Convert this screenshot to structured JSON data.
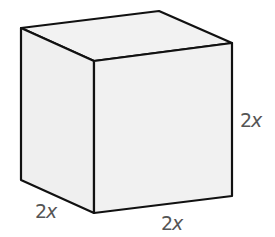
{
  "diagram": {
    "type": "cube",
    "colors": {
      "edge": "#111111",
      "top_face": "#f2f2f2",
      "left_face": "#efefef",
      "front_face": "#f1f1f1",
      "label": "#555555"
    },
    "vertices": {
      "back_top_left": [
        21,
        28
      ],
      "back_top_right": [
        159,
        11
      ],
      "front_top_left": [
        94,
        61
      ],
      "front_top_right": [
        232,
        43
      ],
      "back_bottom_left": [
        21,
        180
      ],
      "front_bottom_left": [
        94,
        213
      ],
      "front_bottom_right": [
        232,
        196
      ]
    },
    "labels": {
      "height": {
        "coefficient": "2",
        "variable": "x"
      },
      "depth": {
        "coefficient": "2",
        "variable": "x"
      },
      "width": {
        "coefficient": "2",
        "variable": "x"
      }
    }
  }
}
